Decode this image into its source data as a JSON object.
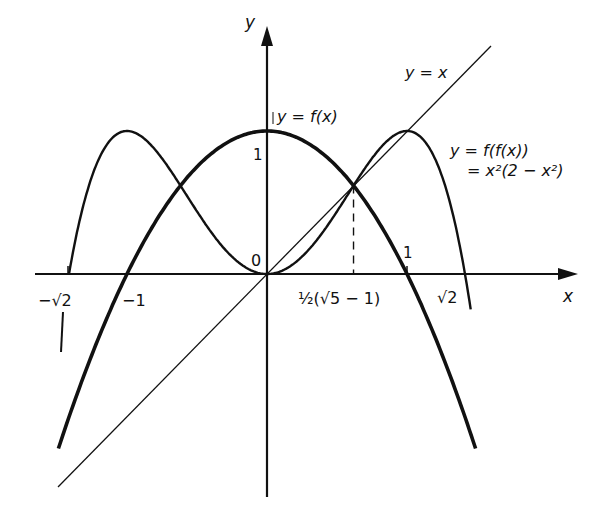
{
  "figure": {
    "background": "#ffffff",
    "ink": "#111111",
    "axes": {
      "x_label": "x",
      "y_label": "y",
      "origin_label": "0"
    },
    "tick_labels": {
      "neg_sqrt2": "−√2",
      "neg_one": "−1",
      "golden": "½(√5 − 1)",
      "one_x": "1",
      "sqrt2": "√2",
      "one_y": "1"
    },
    "curve_labels": {
      "identity": "y = x",
      "f": "y = f(x)",
      "ff_line1": "y = f(f(x))",
      "ff_line2": "= x²(2 − x²)"
    }
  },
  "chart_data": {
    "type": "line",
    "title": "",
    "xlabel": "x",
    "ylabel": "y",
    "xlim": [
      -1.5,
      2.2
    ],
    "ylim": [
      -1.5,
      1.7
    ],
    "grid": false,
    "legend": "inline labels",
    "series": [
      {
        "name": "y = x",
        "formula": "x",
        "style": "thin"
      },
      {
        "name": "y = f(x)",
        "formula": "1 - x^2",
        "style": "thick",
        "points": [
          [
            -1.45,
            -1.1
          ],
          [
            -1,
            0
          ],
          [
            0,
            1
          ],
          [
            1,
            0
          ],
          [
            1.45,
            -1.1
          ]
        ]
      },
      {
        "name": "y = f(f(x)) = x^2(2 - x^2)",
        "formula": "x^2*(2 - x^2)",
        "style": "medium",
        "points": [
          [
            -1.414,
            0
          ],
          [
            -1,
            1
          ],
          [
            0,
            0
          ],
          [
            1,
            1
          ],
          [
            1.414,
            0
          ]
        ]
      }
    ],
    "annotations": [
      {
        "x": 0.618,
        "y": 0.618,
        "label": "½(√5 − 1)",
        "note": "fixed point, dashed drop line to x-axis"
      },
      {
        "x": -1.414,
        "label": "−√2"
      },
      {
        "x": -1,
        "label": "−1"
      },
      {
        "x": 1,
        "label": "1"
      },
      {
        "x": 1.414,
        "label": "√2"
      },
      {
        "y": 1,
        "label": "1"
      }
    ]
  }
}
